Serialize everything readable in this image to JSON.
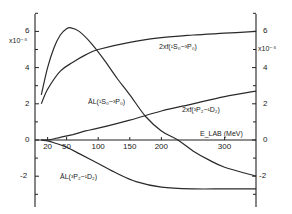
{
  "chart_data": {
    "type": "line",
    "title": "",
    "xlabel": "E_LAB (MeV)",
    "ylabel": "x10^-8",
    "y_scale_label": "x10⁻⁸",
    "xlim": [
      0,
      350
    ],
    "ylim": [
      -3.5,
      7.5
    ],
    "x_ticks": [
      20,
      50,
      100,
      150,
      200,
      300
    ],
    "x_tick_labels": [
      "20",
      "50",
      "100",
      "150",
      "200",
      "300"
    ],
    "y_ticks": [
      6,
      4,
      2,
      0,
      -2
    ],
    "y_tick_labels": [
      "6",
      "4",
      "2",
      "0",
      "-2"
    ],
    "grid": false,
    "legend_position": "inline labels",
    "series": [
      {
        "name": "2xf(1S0-3P0)",
        "label": "2xf(¹S₀−³P₀)",
        "x": [
          10,
          20,
          40,
          60,
          80,
          100,
          150,
          200,
          250,
          300,
          350
        ],
        "values": [
          2.0,
          2.8,
          3.8,
          4.3,
          4.7,
          5.0,
          5.4,
          5.65,
          5.8,
          5.9,
          6.0
        ]
      },
      {
        "name": "A_L(1S0-3P0)",
        "label": "ĀL(¹S₀−³P₀)",
        "x": [
          10,
          20,
          30,
          40,
          50,
          57,
          70,
          90,
          110,
          130,
          150,
          175,
          200,
          226,
          250,
          275,
          300,
          350
        ],
        "values": [
          2.5,
          4.0,
          5.1,
          5.8,
          6.15,
          6.2,
          6.0,
          5.3,
          4.4,
          3.4,
          2.5,
          1.3,
          0.5,
          0.0,
          -0.6,
          -1.1,
          -1.5,
          -2.0
        ]
      },
      {
        "name": "2xf(3P2-1D2)",
        "label": "2xf(³P₂−¹D₂)",
        "x": [
          10,
          20,
          40,
          60,
          80,
          100,
          150,
          200,
          250,
          300,
          350
        ],
        "values": [
          0.0,
          0.0,
          0.15,
          0.3,
          0.5,
          0.65,
          1.1,
          1.6,
          2.0,
          2.4,
          2.7
        ]
      },
      {
        "name": "A_L(3P2-1D2)",
        "label": "ĀL(³P₂−¹D₂)",
        "x": [
          10,
          20,
          30,
          50,
          70,
          100,
          130,
          160,
          200,
          250,
          300,
          350
        ],
        "values": [
          0.0,
          -0.05,
          -0.15,
          -0.4,
          -0.75,
          -1.3,
          -1.85,
          -2.3,
          -2.6,
          -2.7,
          -2.7,
          -2.7
        ]
      }
    ],
    "annotations": [
      "E_LAB(MeV)",
      "x10^-8 (left)",
      "x10^-8 (right)"
    ]
  }
}
